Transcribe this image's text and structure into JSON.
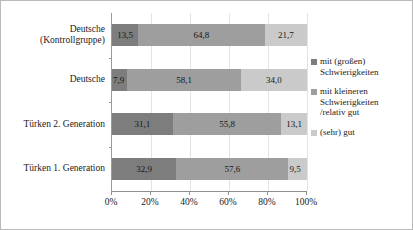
{
  "chart_data": {
    "type": "bar",
    "subtype": "horizontal-stacked-100",
    "title": "",
    "xlabel": "",
    "ylabel": "",
    "xlim": [
      0,
      100
    ],
    "grid": true,
    "legend_position": "right",
    "categories": [
      "Deutsche\n(Kontrollgruppe)",
      "Deutsche",
      "Türken 2. Generation",
      "Türken 1. Generation"
    ],
    "xticks": [
      "0%",
      "20%",
      "40%",
      "60%",
      "80%",
      "100%"
    ],
    "xtick_values": [
      0,
      20,
      40,
      60,
      80,
      100
    ],
    "series": [
      {
        "name": "mit (großen)\nSchwierigkeiten",
        "color": "#7d7d7d",
        "values": [
          13.5,
          7.9,
          31.1,
          32.9
        ],
        "labels": [
          "13,5",
          "7,9",
          "31,1",
          "32,9"
        ]
      },
      {
        "name": "mit kleineren\nSchwierigkeiten\n/relativ gut",
        "color": "#9e9e9e",
        "values": [
          64.8,
          58.1,
          55.8,
          57.6
        ],
        "labels": [
          "64,8",
          "58,1",
          "55,8",
          "57,6"
        ]
      },
      {
        "name": "(sehr) gut",
        "color": "#cacaca",
        "values": [
          21.7,
          34.0,
          13.1,
          9.5
        ],
        "labels": [
          "21,7",
          "34,0",
          "13,1",
          "9,5"
        ]
      }
    ]
  }
}
